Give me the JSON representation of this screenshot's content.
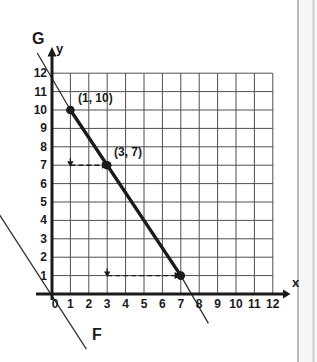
{
  "figure_labels": {
    "line_g": "G",
    "line_f": "F",
    "axis_x": "x",
    "axis_y": "y"
  },
  "colors": {
    "ink": "#1a1a1a",
    "grid": "#4f4f4f",
    "thin_line": "#333333",
    "background": "#ffffff",
    "page_edge_dark": "#ababab",
    "page_edge_light": "#c9c9c9",
    "page_edge_fill": "#f7f7f7"
  },
  "chart_data": {
    "type": "line",
    "title": "",
    "xlabel": "x",
    "ylabel": "y",
    "xlim": [
      0,
      12
    ],
    "ylim": [
      0,
      12
    ],
    "grid": true,
    "x_ticks": [
      0,
      1,
      2,
      3,
      4,
      5,
      6,
      7,
      8,
      9,
      10,
      11,
      12
    ],
    "y_ticks": [
      1,
      2,
      3,
      4,
      5,
      6,
      7,
      8,
      9,
      10,
      11,
      12
    ],
    "series": [
      {
        "name": "G",
        "slope": -1.5,
        "points": [
          [
            1,
            10
          ],
          [
            3,
            7
          ],
          [
            7,
            1
          ]
        ],
        "extended_through": [
          [
            -0.8,
            13.1
          ],
          [
            8.5,
            -1.6
          ]
        ],
        "style": "thick segment between (1,10) and (7,1), thin extensions"
      },
      {
        "name": "F",
        "points": [
          [
            -2.85,
            4.3
          ],
          [
            1.87,
            -3.0
          ]
        ],
        "style": "thin unmarked line, lower-left, roughly parallel to G"
      }
    ],
    "marked_points": [
      {
        "x": 1,
        "y": 10,
        "label": "(1, 10)"
      },
      {
        "x": 3,
        "y": 7,
        "label": "(3, 7)"
      },
      {
        "x": 7,
        "y": 1,
        "label": ""
      }
    ],
    "annotations": [
      {
        "type": "dashed_arrow_right",
        "y": 7,
        "x_from": 1,
        "x_to": 2.85,
        "down_tick_at": [
          1,
          7
        ]
      },
      {
        "type": "dashed_arrow_right",
        "y": 1,
        "x_from": 3,
        "x_to": 6.8,
        "down_tick_at": [
          3,
          1
        ]
      }
    ]
  }
}
